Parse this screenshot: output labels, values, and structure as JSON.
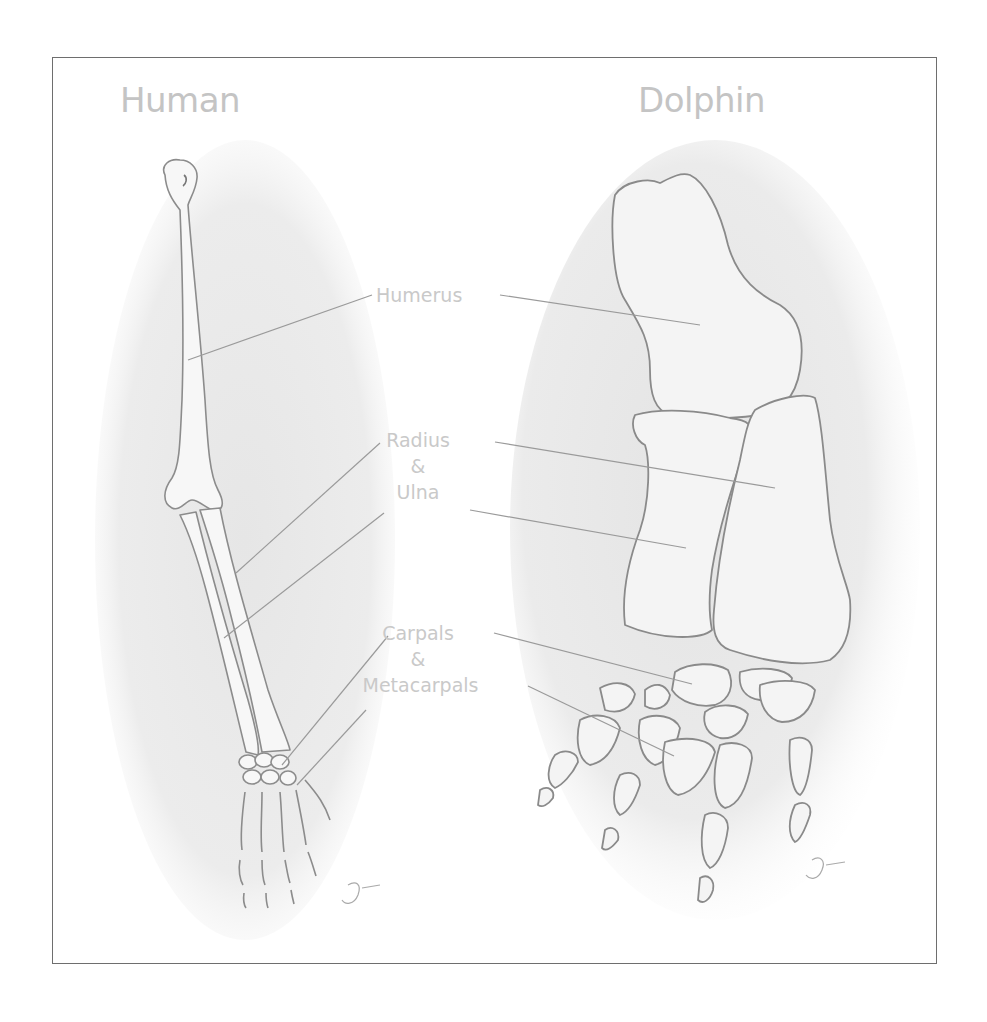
{
  "figure": {
    "type": "comparative-anatomy-diagram",
    "panels": [
      {
        "id": "human",
        "title": "Human"
      },
      {
        "id": "dolphin",
        "title": "Dolphin"
      }
    ],
    "labels": {
      "humerus": "Humerus",
      "radius": "Radius",
      "radius_ulna_amp": "&",
      "ulna": "Ulna",
      "carpals": "Carpals",
      "carpals_meta_amp": "&",
      "metacarpals": "Metacarpals"
    },
    "colors": {
      "frame_border": "#6e6e6e",
      "heading_text": "#c4c4c4",
      "label_text": "#c9c9c9",
      "leader_line": "#9a9a9a",
      "bone_outline": "#8c8c8c",
      "shading": "#e9e9e9"
    }
  }
}
